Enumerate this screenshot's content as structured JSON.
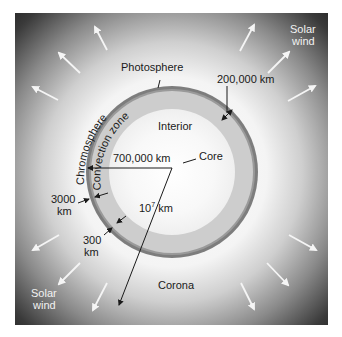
{
  "diagram": {
    "layers": {
      "photosphere": "Photosphere",
      "chromosphere": "Chromosphere",
      "convection_zone": "Convection zone",
      "interior": "Interior",
      "core": "Core",
      "corona": "Corona"
    },
    "measurements": {
      "convection_depth": "200,000 km",
      "radius": "700,000 km",
      "chromosphere_thickness_value": "3000",
      "chromosphere_thickness_unit": "km",
      "photosphere_thickness_value": "300",
      "photosphere_thickness_unit": "km",
      "corona_extent_base": "10",
      "corona_extent_exp": "7",
      "corona_extent_unit": " km"
    },
    "solar_wind": {
      "top_right_line1": "Solar",
      "top_right_line2": "wind",
      "bottom_left_line1": "Solar",
      "bottom_left_line2": "wind"
    },
    "colors": {
      "outer_ring": "#7a7a7a",
      "convection_band": "#cfcfcf",
      "interior": "#ededed",
      "core": "#ffffff",
      "arrows": "#f5f5f5",
      "frame_dark": "#1c1c1c"
    }
  }
}
